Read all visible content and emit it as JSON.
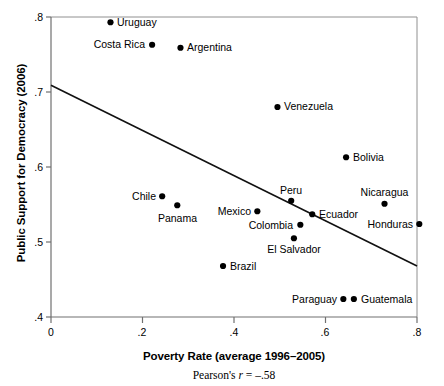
{
  "chart_data": {
    "type": "scatter",
    "title": "",
    "xlabel": "Poverty Rate (average 1996–2005)",
    "ylabel": "Public Support for Democracy (2006)",
    "annotation": "Pearson's r = –.58",
    "annotation_prefix": "Pearson's ",
    "annotation_symbol": "r",
    "annotation_value": " = –.58",
    "xlim": [
      0,
      0.8
    ],
    "ylim": [
      0.4,
      0.8
    ],
    "xticks": [
      "0",
      ".2",
      ".4",
      ".6",
      ".8"
    ],
    "xtick_values": [
      0,
      0.2,
      0.4,
      0.6,
      0.8
    ],
    "yticks": [
      ".4",
      ".5",
      ".6",
      ".7",
      ".8"
    ],
    "ytick_values": [
      0.4,
      0.5,
      0.6,
      0.7,
      0.8
    ],
    "grid": false,
    "legend": "none",
    "trendline": {
      "x": [
        0,
        0.8
      ],
      "y": [
        0.709,
        0.468
      ]
    },
    "points": [
      {
        "label": "Uruguay",
        "x": 0.13,
        "y": 0.793,
        "label_side": "right"
      },
      {
        "label": "Costa Rica",
        "x": 0.221,
        "y": 0.763,
        "label_side": "left"
      },
      {
        "label": "Argentina",
        "x": 0.283,
        "y": 0.759,
        "label_side": "right"
      },
      {
        "label": "Venezuela",
        "x": 0.495,
        "y": 0.68,
        "label_side": "right"
      },
      {
        "label": "Bolivia",
        "x": 0.645,
        "y": 0.613,
        "label_side": "right"
      },
      {
        "label": "Nicaragua",
        "x": 0.729,
        "y": 0.551,
        "label_side": "above"
      },
      {
        "label": "Chile",
        "x": 0.243,
        "y": 0.561,
        "label_side": "left"
      },
      {
        "label": "Panama",
        "x": 0.276,
        "y": 0.549,
        "label_side": "below"
      },
      {
        "label": "Mexico",
        "x": 0.451,
        "y": 0.541,
        "label_side": "left"
      },
      {
        "label": "Peru",
        "x": 0.525,
        "y": 0.555,
        "label_side": "above"
      },
      {
        "label": "Ecuador",
        "x": 0.571,
        "y": 0.537,
        "label_side": "right"
      },
      {
        "label": "Colombia",
        "x": 0.545,
        "y": 0.523,
        "label_side": "left"
      },
      {
        "label": "El Salvador",
        "x": 0.531,
        "y": 0.505,
        "label_side": "below"
      },
      {
        "label": "Honduras",
        "x": 0.805,
        "y": 0.524,
        "label_side": "left"
      },
      {
        "label": "Brazil",
        "x": 0.376,
        "y": 0.468,
        "label_side": "right"
      },
      {
        "label": "Paraguay",
        "x": 0.639,
        "y": 0.424,
        "label_side": "left"
      },
      {
        "label": "Guatemala",
        "x": 0.662,
        "y": 0.424,
        "label_side": "right"
      }
    ]
  },
  "style": {
    "axis_color": "#808080",
    "line_color": "#000000",
    "point_color": "#000000",
    "background": "#ffffff"
  }
}
